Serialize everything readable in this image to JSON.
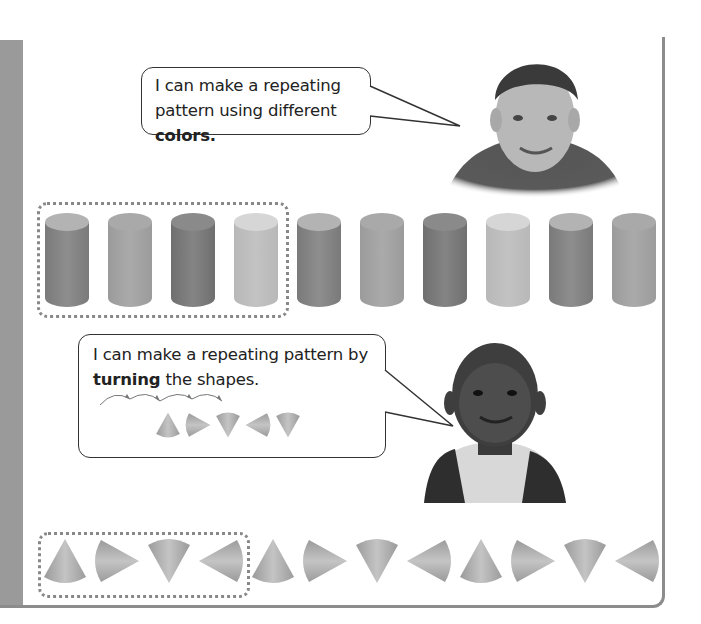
{
  "speech_bubbles": [
    {
      "line1": "I can make a repeating",
      "line2_prefix": "pattern using different ",
      "line2_bold": "colors."
    },
    {
      "line1": "I can make a repeating pattern by",
      "line2_bold": "turning",
      "line2_suffix": " the shapes."
    }
  ],
  "photos": [
    {
      "subject": "boy-smiling-photo-1"
    },
    {
      "subject": "boy-smiling-photo-2"
    }
  ],
  "cylinder_pattern": {
    "unit_size": 4,
    "count": 10,
    "shades": [
      "#7a7a7a",
      "#9b9b9b",
      "#6f6f6f",
      "#b8b8b8",
      "#7a7a7a",
      "#9b9b9b",
      "#6f6f6f",
      "#b8b8b8",
      "#7a7a7a",
      "#9b9b9b"
    ],
    "top_shades": [
      "#b3b3b3",
      "#a9a9a9",
      "#8a8a8a",
      "#d6d6d6",
      "#b3b3b3",
      "#a9a9a9",
      "#8a8a8a",
      "#d6d6d6",
      "#b3b3b3",
      "#a9a9a9"
    ]
  },
  "cone_pattern": {
    "unit_size": 4,
    "orientations": [
      "up",
      "right",
      "down",
      "left",
      "up",
      "right",
      "down",
      "left",
      "up",
      "right",
      "down",
      "left"
    ]
  },
  "mini_cone_example": {
    "orientations": [
      "up",
      "right",
      "down",
      "left",
      "down"
    ]
  },
  "colors": {
    "frame": "#8c8c8c",
    "left_bar": "#9a9a9a",
    "dotted_outline": "#888888"
  }
}
